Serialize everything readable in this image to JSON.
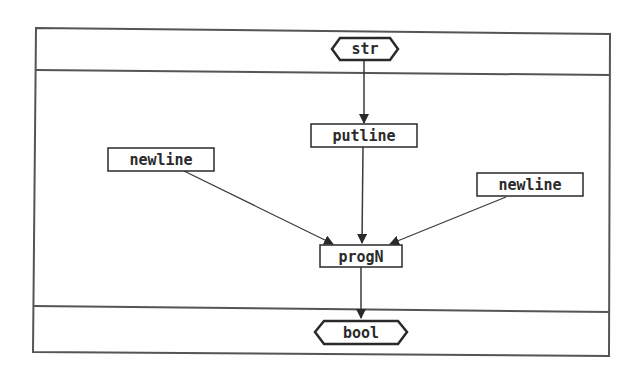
{
  "diagram": {
    "type": "dataflow",
    "frame_color": "#555555",
    "edge_color": "#3a3a3a",
    "sections": [
      {
        "name": "input-section"
      },
      {
        "name": "body-section"
      },
      {
        "name": "output-section"
      }
    ],
    "nodes": {
      "input": {
        "label": "str",
        "shape": "hexagon"
      },
      "putline": {
        "label": "putline",
        "shape": "box"
      },
      "newline_left": {
        "label": "newline",
        "shape": "box"
      },
      "newline_right": {
        "label": "newline",
        "shape": "box"
      },
      "progn": {
        "label": "progN",
        "shape": "box"
      },
      "output": {
        "label": "bool",
        "shape": "hexagon"
      }
    },
    "edges": [
      {
        "from": "str",
        "to": "putline"
      },
      {
        "from": "putline",
        "to": "progN"
      },
      {
        "from": "newline (left)",
        "to": "progN"
      },
      {
        "from": "newline (right)",
        "to": "progN"
      },
      {
        "from": "progN",
        "to": "bool"
      }
    ]
  }
}
